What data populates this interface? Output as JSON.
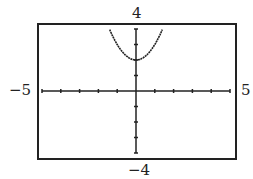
{
  "chart_data": {
    "type": "line",
    "title": "",
    "function": "y = x^2 + 2",
    "xlabel": "",
    "ylabel": "",
    "xlim": [
      -5,
      5
    ],
    "ylim": [
      -4,
      4
    ],
    "xscale": 1,
    "yscale": 1,
    "grid": false,
    "series": [
      {
        "name": "parabola",
        "x": [
          -1.41,
          -1,
          -0.5,
          0,
          0.5,
          1,
          1.41
        ],
        "y": [
          4,
          3,
          2.25,
          2,
          2.25,
          3,
          4
        ]
      }
    ]
  },
  "labels": {
    "ymax": "4",
    "ymin": "−4",
    "xmin": "−5",
    "xmax": "5"
  },
  "colors": {
    "axis": "#222222",
    "curve": "#222222",
    "frame": "#222222"
  }
}
